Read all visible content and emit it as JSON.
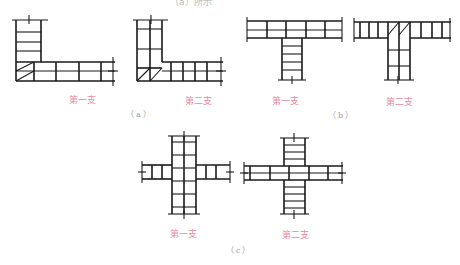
{
  "header": {
    "cut_off_text": "（a）所示"
  },
  "figures": [
    {
      "id": "a",
      "caption": "（a）",
      "description": "L-shaped wall corner brick bonding",
      "panels": [
        {
          "label": "第一支"
        },
        {
          "label": "第二支"
        }
      ]
    },
    {
      "id": "b",
      "caption": "（b）",
      "description": "T-shaped wall junction brick bonding",
      "panels": [
        {
          "label": "第一支"
        },
        {
          "label": "第二支"
        }
      ]
    },
    {
      "id": "c",
      "caption": "（c）",
      "description": "Cross-shaped wall intersection brick bonding",
      "panels": [
        {
          "label": "第一支"
        },
        {
          "label": "第二支"
        }
      ]
    }
  ],
  "colors": {
    "line": "#1a1a1a",
    "label": "#e8899f",
    "caption": "#9a9a9a"
  }
}
